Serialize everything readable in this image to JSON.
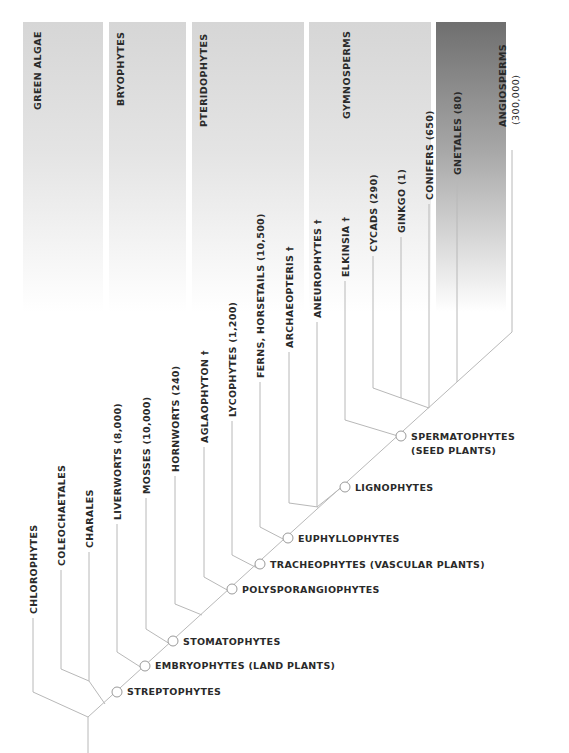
{
  "groups": [
    {
      "id": "green-algae",
      "label": "GREEN ALGAE"
    },
    {
      "id": "bryophytes",
      "label": "BRYOPHYTES"
    },
    {
      "id": "pteridophytes",
      "label": "PTERIDOPHYTES"
    },
    {
      "id": "gymnosperms",
      "label": "GYMNOSPERMS"
    },
    {
      "id": "angiosperms",
      "label": "ANGIOSPERMS",
      "sublabel": "(300,000)"
    }
  ],
  "leaves": [
    {
      "label": "CHLOROPHYTES"
    },
    {
      "label": "COLEOCHAETALES"
    },
    {
      "label": "CHARALES"
    },
    {
      "label": "LIVERWORTS (8,000)"
    },
    {
      "label": "MOSSES (10,000)"
    },
    {
      "label": "HORNWORTS (240)"
    },
    {
      "label": "AGLAOPHYTON †"
    },
    {
      "label": "LYCOPHYTES (1,200)"
    },
    {
      "label": "FERNS, HORSETAILS (10,500)"
    },
    {
      "label": "ARCHAEOPTERIS †"
    },
    {
      "label": "ANEUROPHYTES †"
    },
    {
      "label": "ELKINSIA †"
    },
    {
      "label": "CYCADS (290)"
    },
    {
      "label": "GINKGO (1)"
    },
    {
      "label": "CONIFERS (650)"
    },
    {
      "label": "GNETALES (80)"
    }
  ],
  "nodes": [
    {
      "label": "STREPTOPHYTES"
    },
    {
      "label": "EMBRYOPHYTES (LAND PLANTS)"
    },
    {
      "label": "STOMATOPHYTES"
    },
    {
      "label": "POLYSPORANGIOPHYTES"
    },
    {
      "label": "TRACHEOPHYTES (VASCULAR PLANTS)"
    },
    {
      "label": "EUPHYLLOPHYTES"
    },
    {
      "label": "LIGNOPHYTES"
    },
    {
      "label": "SPERMATOPHYTES",
      "sublabel": "(SEED PLANTS)"
    }
  ],
  "colors": {
    "line": "#b8b8b8",
    "text": "#2a2a2a",
    "band_light": "#d6d6d6",
    "band_dark": "#6f6f6f"
  }
}
